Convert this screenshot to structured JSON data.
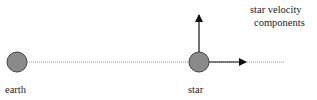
{
  "diagram": {
    "earth": {
      "label": "earth",
      "fill": "#8a8a8a",
      "stroke": "#444444"
    },
    "star": {
      "label": "star",
      "fill": "#8a8a8a",
      "stroke": "#444444"
    },
    "velocity_label_line1": "star velocity",
    "velocity_label_line2": "components",
    "line_color": "#999999",
    "arrow_color": "#111111"
  }
}
